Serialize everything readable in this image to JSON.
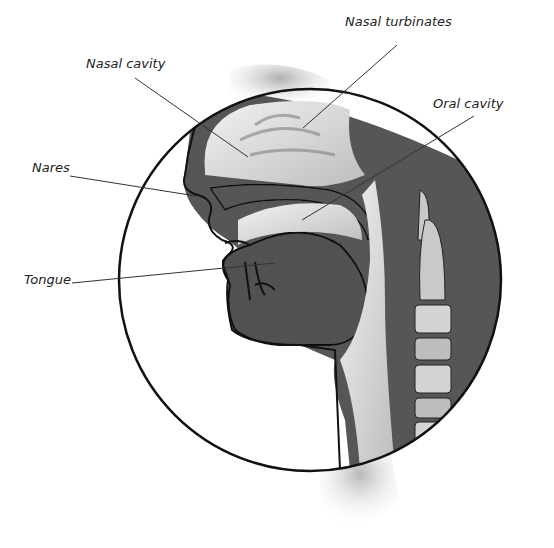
{
  "diagram": {
    "type": "anatomical cross-section",
    "labels": [
      {
        "id": "nasal-turbinates",
        "text": "Nasal turbinates",
        "x": 395,
        "y": 22,
        "line": [
          [
            397,
            45
          ],
          [
            303,
            128
          ]
        ]
      },
      {
        "id": "nasal-cavity",
        "text": "Nasal cavity",
        "x": 86,
        "y": 60,
        "line": [
          [
            135,
            78
          ],
          [
            248,
            157
          ]
        ]
      },
      {
        "id": "oral-cavity",
        "text": "Oral cavity",
        "x": 433,
        "y": 99,
        "line": [
          [
            474,
            116
          ],
          [
            302,
            220
          ]
        ]
      },
      {
        "id": "nares",
        "text": "Nares",
        "x": 32,
        "y": 160,
        "line": [
          [
            70,
            176
          ],
          [
            196,
            196
          ]
        ]
      },
      {
        "id": "tongue",
        "text": "Tongue",
        "x": 24,
        "y": 273,
        "line": [
          [
            72,
            283
          ],
          [
            275,
            263
          ]
        ]
      }
    ],
    "colors": {
      "tissue": "#5a5a5a",
      "cavity": "#d8d8d8",
      "outline": "#111111",
      "bone": "#c9c9c9",
      "label": "#222222"
    }
  }
}
